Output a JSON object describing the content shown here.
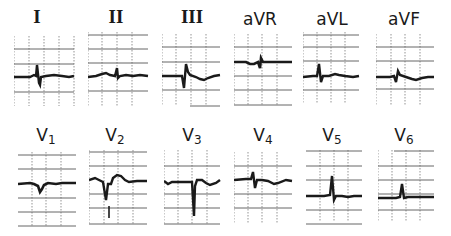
{
  "figure": {
    "leads": [
      {
        "id": "I",
        "label": "I",
        "sub": "",
        "roman": true
      },
      {
        "id": "II",
        "label": "II",
        "sub": "",
        "roman": true
      },
      {
        "id": "III",
        "label": "III",
        "sub": "",
        "roman": true
      },
      {
        "id": "aVR",
        "label": "aVR",
        "sub": "",
        "roman": false
      },
      {
        "id": "aVL",
        "label": "aVL",
        "sub": "",
        "roman": false
      },
      {
        "id": "aVF",
        "label": "aVF",
        "sub": "",
        "roman": false
      },
      {
        "id": "V1",
        "label": "V",
        "sub": "1",
        "roman": false
      },
      {
        "id": "V2",
        "label": "V",
        "sub": "2",
        "roman": false
      },
      {
        "id": "V3",
        "label": "V",
        "sub": "3",
        "roman": false
      },
      {
        "id": "V4",
        "label": "V",
        "sub": "4",
        "roman": false
      },
      {
        "id": "V5",
        "label": "V",
        "sub": "5",
        "roman": false
      },
      {
        "id": "V6",
        "label": "V",
        "sub": "6",
        "roman": false
      }
    ],
    "colors": {
      "trace": "#1a1a1a",
      "grid": "#555555",
      "background": "#ffffff"
    }
  }
}
